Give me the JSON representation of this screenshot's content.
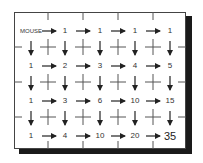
{
  "diagram": {
    "title": "",
    "start_label": "MOUSE",
    "grid": {
      "rows": 4,
      "cols": 5,
      "values": [
        [
          "",
          "1",
          "1",
          "1",
          "1"
        ],
        [
          "1",
          "2",
          "3",
          "4",
          "5"
        ],
        [
          "1",
          "3",
          "6",
          "10",
          "15"
        ],
        [
          "1",
          "4",
          "10",
          "20",
          "35"
        ]
      ]
    },
    "final_value": "35",
    "arrow_direction_horizontal": "right",
    "arrow_direction_vertical": "down",
    "colors": {
      "line": "#555555",
      "arrow": "#222222",
      "text": "#333333",
      "shadow": "#1a1a1a",
      "background": "#ffffff"
    }
  }
}
